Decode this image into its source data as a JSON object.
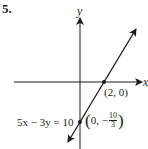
{
  "problem_number": "5.",
  "axes": {
    "x_label": "x",
    "y_label": "y"
  },
  "equation": "5x − 3y = 10",
  "points": [
    {
      "name": "x-intercept",
      "label": "(2, 0)",
      "x": 2,
      "y": 0
    },
    {
      "name": "y-intercept",
      "label_prefix": "0, −",
      "frac_num": "10",
      "frac_den": "3",
      "x": 0,
      "y": -3.333
    }
  ],
  "colors": {
    "ink": "#1a1a1a",
    "background": "#ffffff"
  }
}
